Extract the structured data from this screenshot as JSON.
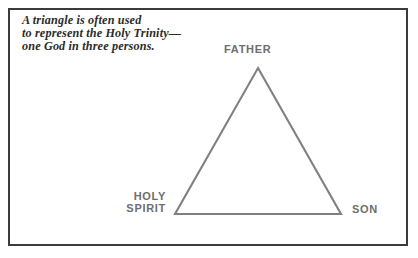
{
  "figure": {
    "caption_lines": [
      "A triangle is often used",
      "to represent the Holy Trinity—",
      "one God in three persons."
    ],
    "labels": {
      "apex": "FATHER",
      "bottom_left_line1": "HOLY",
      "bottom_left_line2": "SPIRIT",
      "bottom_right": "SON"
    },
    "colors": {
      "border": "#3b3b3b",
      "triangle_stroke": "#808080",
      "label_text": "#6e6e6e",
      "caption_text": "#2b2b2b",
      "background": "#ffffff"
    },
    "geometry": {
      "apex_x": 258,
      "apex_y": 68,
      "bottom_left_x": 175,
      "bottom_left_y": 214,
      "bottom_right_x": 341,
      "bottom_right_y": 214
    }
  }
}
